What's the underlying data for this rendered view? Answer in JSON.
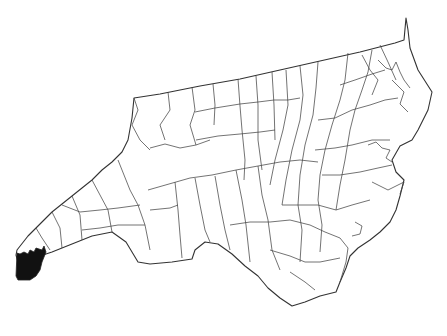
{
  "map": {
    "region": "North Carolina",
    "subdivision": "counties",
    "highlighted_county": "Cherokee County",
    "colors": {
      "background": "#ffffff",
      "county_fill": "#ffffff",
      "border": "#333333",
      "highlight_fill": "#111111"
    }
  }
}
